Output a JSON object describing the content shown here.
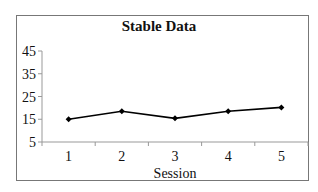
{
  "chart_data": {
    "type": "line",
    "title": "Stable Data",
    "xlabel": "Session",
    "ylabel": "",
    "categories": [
      "1",
      "2",
      "3",
      "4",
      "5"
    ],
    "x": [
      1,
      2,
      3,
      4,
      5
    ],
    "series": [
      {
        "name": "Stable Data",
        "values": [
          15,
          18.5,
          15.4,
          18.5,
          20.2
        ],
        "color": "#000000",
        "marker": "diamond"
      }
    ],
    "ylim": [
      5,
      45
    ],
    "yticks": [
      5,
      15,
      25,
      35,
      45
    ],
    "ytick_labels": [
      "5",
      "15",
      "25",
      "35",
      "45"
    ],
    "grid": false,
    "legend": "none"
  },
  "header": {
    "cut_off_text": ""
  }
}
